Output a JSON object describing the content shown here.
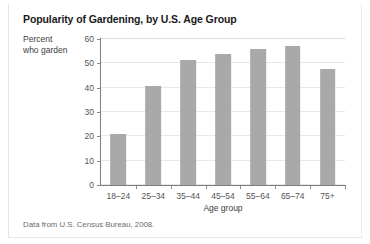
{
  "figure": {
    "title": "Popularity of Gardening, by U.S. Age Group",
    "caption": "Data from U.S. Census Bureau, 2008."
  },
  "chart_data": {
    "type": "bar",
    "title": "Popularity of Gardening, by U.S. Age Group",
    "categories": [
      "18–24",
      "25–34",
      "35–44",
      "45–54",
      "55–64",
      "65–74",
      "75+"
    ],
    "values": [
      21,
      40.5,
      51.5,
      54,
      56,
      57,
      47.5
    ],
    "xlabel": "Age group",
    "ylabel": "Percent who garden",
    "ylabel_lines": [
      "Percent",
      "who garden"
    ],
    "ylim": [
      0,
      60
    ],
    "yticks": [
      60,
      50,
      40,
      30,
      20,
      10,
      0
    ],
    "ytick_labels": [
      "60",
      "50",
      "40",
      "30",
      "20",
      "10",
      "0"
    ],
    "grid": true,
    "grid_axis": "y",
    "legend": null,
    "bar_color": "#a9a9a9",
    "plot_background": "#ffffff",
    "axis_color": "#7d7d7d",
    "grid_color": "#e8e8e8"
  }
}
